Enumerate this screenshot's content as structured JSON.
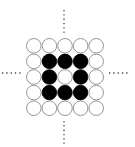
{
  "diagram": {
    "rows": 5,
    "cols": 5,
    "grid_origin": [
      26,
      38
    ],
    "cell_size": 15.6,
    "radius": 7.3,
    "filled_color": "#000000",
    "empty_stroke": "#8a8a8a",
    "dot_color": "#444444",
    "cells": [
      [
        0,
        0,
        0,
        0,
        0
      ],
      [
        0,
        1,
        1,
        1,
        0
      ],
      [
        0,
        1,
        0,
        1,
        0
      ],
      [
        0,
        1,
        1,
        1,
        0
      ],
      [
        0,
        0,
        0,
        0,
        0
      ]
    ],
    "dotted_lines": [
      {
        "name": "top",
        "x1": 64,
        "y1": 10,
        "x2": 64,
        "y2": 33
      },
      {
        "name": "bottom",
        "x1": 64,
        "y1": 121,
        "x2": 64,
        "y2": 144
      },
      {
        "name": "left",
        "x1": 2,
        "y1": 73,
        "x2": 22,
        "y2": 73
      },
      {
        "name": "right",
        "x1": 109,
        "y1": 73,
        "x2": 130,
        "y2": 73
      }
    ]
  }
}
